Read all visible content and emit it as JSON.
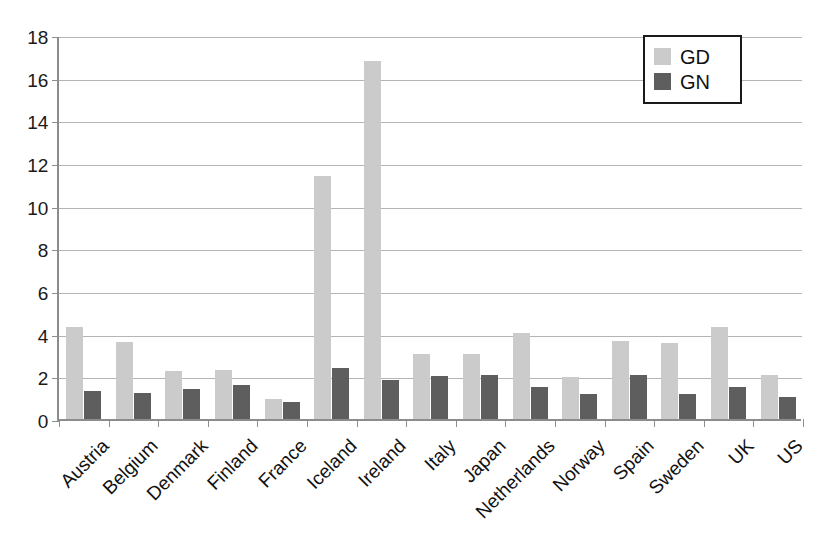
{
  "chart_data": {
    "type": "bar",
    "title": "",
    "xlabel": "",
    "ylabel": "",
    "ylim": [
      0,
      18
    ],
    "ytick_step": 2,
    "yticks": [
      "0",
      "2",
      "4",
      "6",
      "8",
      "10",
      "12",
      "14",
      "16",
      "18"
    ],
    "grid": "horizontal",
    "legend_position": "top-right",
    "categories": [
      "Austria",
      "Belgium",
      "Denmark",
      "Finland",
      "France",
      "Iceland",
      "Ireland",
      "Italy",
      "Japan",
      "Netherlands",
      "Norway",
      "Spain",
      "Sweden",
      "UK",
      "US"
    ],
    "series": [
      {
        "name": "GD",
        "color": "#cbcbcb",
        "values": [
          4.3,
          3.6,
          2.25,
          2.3,
          0.95,
          11.4,
          16.8,
          3.05,
          3.05,
          4.05,
          1.95,
          3.65,
          3.55,
          4.3,
          2.05
        ]
      },
      {
        "name": "GN",
        "color": "#5e5e5e",
        "values": [
          1.3,
          1.2,
          1.4,
          1.6,
          0.8,
          2.4,
          1.85,
          2.0,
          2.05,
          1.5,
          1.15,
          2.05,
          1.15,
          1.5,
          1.05
        ]
      }
    ]
  },
  "legend": {
    "items": [
      {
        "label": "GD",
        "swatch": "gd"
      },
      {
        "label": "GN",
        "swatch": "gn"
      }
    ]
  }
}
